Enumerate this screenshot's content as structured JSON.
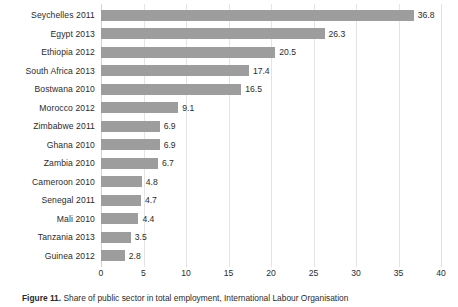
{
  "chart_data": {
    "type": "bar",
    "orientation": "horizontal",
    "title": "",
    "xlabel": "",
    "ylabel": "",
    "xlim": [
      0,
      40
    ],
    "xticks": [
      "0",
      "5",
      "10",
      "15",
      "20",
      "25",
      "30",
      "35",
      "40"
    ],
    "grid": true,
    "legend": "none",
    "bar_color": "#9d9d9d",
    "categories": [
      "Seychelles 2011",
      "Egypt 2013",
      "Ethiopia 2012",
      "South Africa 2013",
      "Bostwana 2010",
      "Morocco 2012",
      "Zimbabwe 2011",
      "Ghana 2010",
      "Zambia 2010",
      "Cameroon 2010",
      "Senegal 2011",
      "Mali 2010",
      "Tanzania 2013",
      "Guinea 2012"
    ],
    "values": [
      36.8,
      26.3,
      20.5,
      17.4,
      16.5,
      9.1,
      6.9,
      6.9,
      6.7,
      4.8,
      4.7,
      4.4,
      3.5,
      2.8
    ],
    "value_labels": [
      "36.8",
      "26.3",
      "20.5",
      "17.4",
      "16.5",
      "9.1",
      "6.9",
      "6.9",
      "6.7",
      "4.8",
      "4.7",
      "4.4",
      "3.5",
      "2.8"
    ]
  },
  "caption": {
    "label": "Figure 11.",
    "text": "Share of public sector in total employment, International Labour Organisation"
  }
}
